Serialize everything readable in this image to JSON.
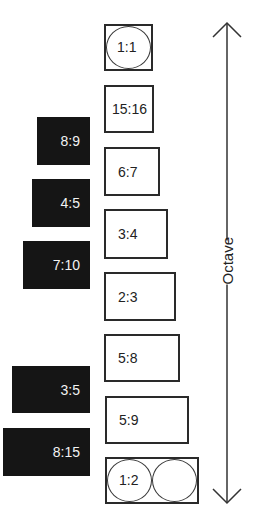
{
  "diagram": {
    "axis_label": "Octave",
    "arrow": "double-headed vertical",
    "consonant_ratios": [
      {
        "label": "1:1",
        "style": "square-with-circle"
      },
      {
        "label": "15:16"
      },
      {
        "label": "6:7"
      },
      {
        "label": "3:4"
      },
      {
        "label": "2:3"
      },
      {
        "label": "5:8"
      },
      {
        "label": "5:9"
      },
      {
        "label": "1:2",
        "style": "rectangle-with-two-circles"
      }
    ],
    "dark_ratios": [
      {
        "label": "8:9"
      },
      {
        "label": "4:5"
      },
      {
        "label": "7:10"
      },
      {
        "label": "3:5"
      },
      {
        "label": "8:15"
      }
    ],
    "colors": {
      "dark_fill": "#151515",
      "outline": "#2a2a2a",
      "background": "#ffffff"
    }
  }
}
